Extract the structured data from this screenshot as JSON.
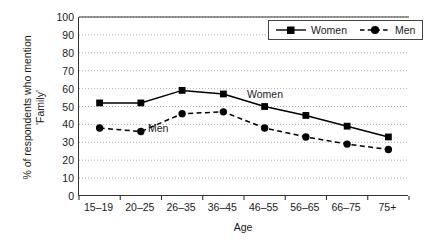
{
  "chart_data": {
    "type": "line",
    "title": "",
    "xlabel": "Age",
    "ylabel": "% of respondents who mention\n'Family'",
    "categories": [
      "15–19",
      "20–25",
      "26–35",
      "36–45",
      "46–55",
      "56–65",
      "66–75",
      "75+"
    ],
    "series": [
      {
        "name": "Women",
        "values": [
          52,
          52,
          59,
          57,
          50,
          45,
          39,
          33
        ],
        "marker": "square",
        "linestyle": "solid",
        "color": "#000000"
      },
      {
        "name": "Men",
        "values": [
          38,
          36,
          46,
          47,
          38,
          33,
          29,
          26
        ],
        "marker": "circle",
        "linestyle": "dashed",
        "color": "#000000"
      }
    ],
    "ylim": [
      0,
      100
    ],
    "ytick_step": 10,
    "yticks": [
      0,
      10,
      20,
      30,
      40,
      50,
      60,
      70,
      80,
      90,
      100
    ],
    "grid": "horizontal-dotted",
    "legend_position": "top-right",
    "annotations": [
      {
        "text": "Women",
        "series": "Women"
      },
      {
        "text": "Men",
        "series": "Men"
      }
    ]
  },
  "legend": {
    "items": [
      {
        "label": "Women"
      },
      {
        "label": "Men"
      }
    ]
  },
  "axes": {
    "x_title": "Age",
    "y_title": "% of respondents who mention\n'Family'"
  }
}
